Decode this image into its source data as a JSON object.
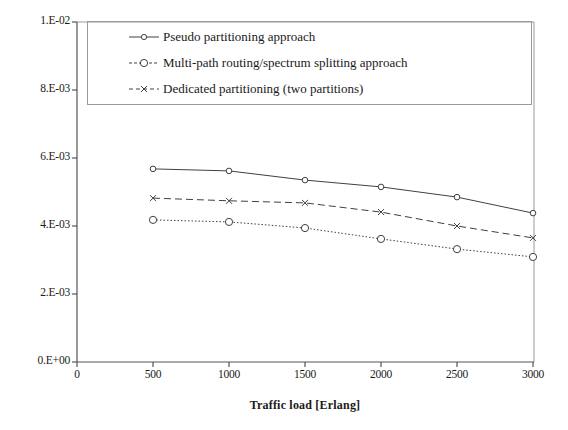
{
  "chart_data": {
    "type": "line",
    "title": "",
    "xlabel": "Traffic load [Erlang]",
    "ylabel": "Contiguous aligned available slot ratio",
    "x": [
      500,
      1000,
      1500,
      2000,
      2500,
      3000
    ],
    "xlim": [
      0,
      3000
    ],
    "ylim": [
      0,
      0.01
    ],
    "xticks": [
      "0",
      "500",
      "1000",
      "1500",
      "2000",
      "2500",
      "3000"
    ],
    "xtick_values": [
      0,
      500,
      1000,
      1500,
      2000,
      2500,
      3000
    ],
    "yticks": [
      "0.E+00",
      "2.E-03",
      "4.E-03",
      "6.E-03",
      "8.E-03",
      "1.E-02"
    ],
    "ytick_values": [
      0,
      0.002,
      0.004,
      0.006,
      0.008,
      0.01
    ],
    "grid": false,
    "legend_position": "upper-left-inside",
    "series": [
      {
        "name": "Pseudo partitioning approach",
        "values": [
          0.00568,
          0.00562,
          0.00535,
          0.00515,
          0.00485,
          0.00438
        ],
        "line_style": "solid",
        "marker": "circle-small",
        "color": "#404040"
      },
      {
        "name": "Multi-path routing/spectrum splitting  approach",
        "values": [
          0.00418,
          0.00412,
          0.00394,
          0.00362,
          0.00332,
          0.00309
        ],
        "line_style": "dotted",
        "marker": "circle-open",
        "color": "#404040"
      },
      {
        "name": "Dedicated partitioning (two partitions)",
        "values": [
          0.00482,
          0.00474,
          0.00468,
          0.00441,
          0.004,
          0.00365
        ],
        "line_style": "dashed",
        "marker": "x",
        "color": "#404040"
      }
    ]
  },
  "axes": {
    "plot_border_color": "#9a9a9a",
    "axis_color": "#555555"
  }
}
